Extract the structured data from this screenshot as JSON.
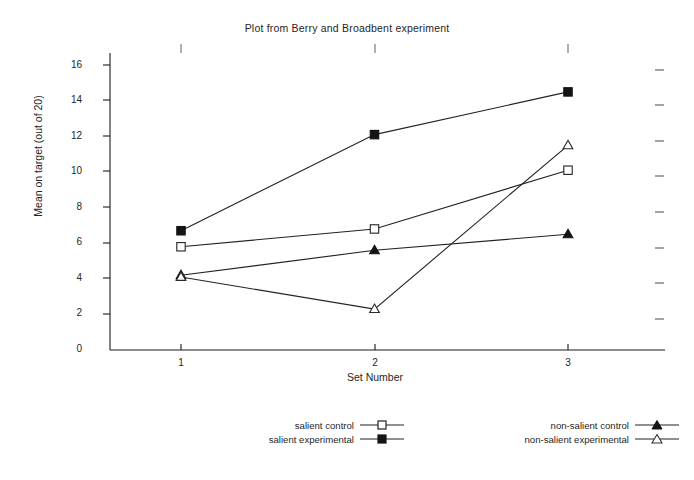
{
  "chart_data": {
    "type": "line",
    "title": "Plot from Berry and Broadbent experiment",
    "xlabel": "Set Number",
    "ylabel": "Mean on target (out of 20)",
    "categories": [
      "1",
      "2",
      "3"
    ],
    "x": [
      1,
      2,
      3
    ],
    "xlim": [
      0.6,
      3.4
    ],
    "ylim": [
      0,
      17
    ],
    "yticks": [
      "0",
      "2",
      "4",
      "6",
      "8",
      "10",
      "12",
      "14",
      "16"
    ],
    "ytick_values": [
      0,
      2,
      4,
      6,
      8,
      10,
      12,
      14,
      16
    ],
    "grid": false,
    "legend_position": "bottom",
    "series": [
      {
        "name": "salient control",
        "marker": "open-square",
        "values": [
          5.8,
          6.8,
          10.1
        ]
      },
      {
        "name": "salient experimental",
        "marker": "filled-square",
        "values": [
          6.7,
          12.1,
          14.5
        ]
      },
      {
        "name": "non-salient control",
        "marker": "filled-triangle",
        "values": [
          4.2,
          5.6,
          6.5
        ]
      },
      {
        "name": "non-salient experimental",
        "marker": "open-triangle",
        "values": [
          4.1,
          2.3,
          11.5
        ]
      }
    ],
    "line_color": "#222222",
    "axis_color": "#1a1a1a",
    "background": "#ffffff"
  },
  "legend": {
    "left": [
      {
        "label": "salient control",
        "marker": "open-square"
      },
      {
        "label": "salient experimental",
        "marker": "filled-square"
      }
    ],
    "right": [
      {
        "label": "non-salient control",
        "marker": "filled-triangle"
      },
      {
        "label": "non-salient experimental",
        "marker": "open-triangle"
      }
    ]
  },
  "axes": {
    "ytick_labels": [
      "16",
      "14",
      "12",
      "10",
      "8",
      "6",
      "4",
      "2",
      "0"
    ],
    "xtick_labels": [
      "1",
      "2",
      "3"
    ]
  }
}
